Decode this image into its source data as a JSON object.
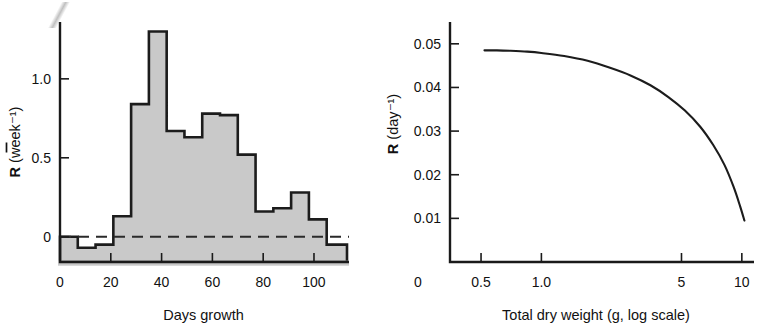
{
  "figure": {
    "panel_left_name": "growth-rate-histogram-panel",
    "panel_right_name": "dry-weight-curve-panel",
    "scan_artifact_text": "g g"
  },
  "chart_data": [
    {
      "type": "bar",
      "id": "left",
      "title": "",
      "xlabel": "Days growth",
      "ylabel": "R̄ (week⁻¹)",
      "ylabel_parts": {
        "symbol": "R",
        "overbar": true,
        "units": "(week⁻¹)"
      },
      "xlim": [
        0,
        113
      ],
      "ylim": [
        -0.16,
        1.36
      ],
      "xticks": [
        0,
        20,
        40,
        60,
        80,
        100
      ],
      "xticklabels": [
        "0",
        "20",
        "40",
        "60",
        "80",
        "100"
      ],
      "yticks": [
        0,
        0.5,
        1.0
      ],
      "yticklabels": [
        "0",
        "0.5",
        "1.0"
      ],
      "grid": false,
      "legend": "none",
      "zero_line": {
        "value": 0,
        "style": "dashed"
      },
      "bar_edges": [
        0,
        7,
        14,
        21,
        28,
        35,
        42,
        49,
        56,
        63,
        70,
        77,
        84,
        91,
        98,
        105,
        113
      ],
      "categories": [
        "0-7",
        "7-14",
        "14-21",
        "21-28",
        "28-35",
        "35-42",
        "42-49",
        "49-56",
        "56-63",
        "63-70",
        "70-77",
        "77-84",
        "84-91",
        "91-98",
        "98-105",
        "105-113"
      ],
      "values": [
        0.0,
        -0.07,
        -0.05,
        0.13,
        0.84,
        1.3,
        0.67,
        0.63,
        0.78,
        0.77,
        0.52,
        0.16,
        0.18,
        0.28,
        0.11,
        -0.05
      ],
      "fill_color": "#c9c9c9",
      "edge_color": "#1c1c1c"
    },
    {
      "type": "line",
      "id": "right",
      "title": "",
      "xlabel": "Total dry weight (g, log scale)",
      "ylabel": "R (day⁻¹)",
      "ylabel_parts": {
        "symbol": "R",
        "overbar": false,
        "units": "(day⁻¹)"
      },
      "x_scale": "log",
      "xlim": [
        0.35,
        11.5
      ],
      "ylim": [
        0,
        0.055
      ],
      "xticks": [
        0.5,
        1.0,
        5,
        10
      ],
      "xticklabels": [
        "0.5",
        "1.0",
        "5",
        "10"
      ],
      "x_origin_label": "0",
      "yticks": [
        0.01,
        0.02,
        0.03,
        0.04,
        0.05
      ],
      "yticklabels": [
        "0.01",
        "0.02",
        "0.03",
        "0.04",
        "0.05"
      ],
      "grid": false,
      "legend": "none",
      "x": [
        0.52,
        0.6,
        0.7,
        0.85,
        1.0,
        1.3,
        1.7,
        2.2,
        2.8,
        3.5,
        4.3,
        5.2,
        6.2,
        7.2,
        8.2,
        9.1,
        9.8,
        10.3
      ],
      "y": [
        0.0485,
        0.0485,
        0.0484,
        0.0482,
        0.0479,
        0.0472,
        0.0461,
        0.0445,
        0.0427,
        0.0405,
        0.0378,
        0.0347,
        0.031,
        0.0268,
        0.0222,
        0.0172,
        0.0128,
        0.0095
      ],
      "line_color": "#1c1c1c"
    }
  ]
}
